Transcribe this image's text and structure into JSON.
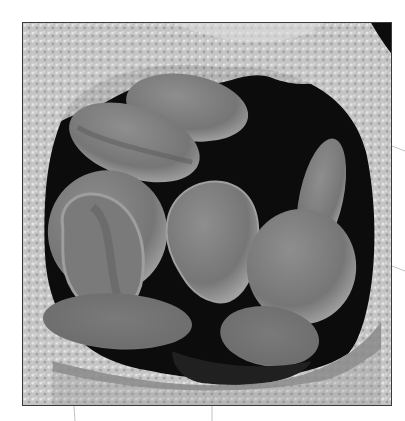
{
  "figure": {
    "type": "scanning-electron-micrograph",
    "colors": {
      "background": "#ffffff",
      "lumen": "#0c0c0c",
      "cell": "#7c7c7c",
      "cell_highlight": "#a0a0a0",
      "vessel_wall": "#c8c8c8",
      "border": "#3a3a3a",
      "leader": "#b8b8b8"
    },
    "leader_lines": [
      {
        "side": "right",
        "y": 148
      },
      {
        "side": "right",
        "y": 268
      },
      {
        "side": "bottom",
        "x": 74
      },
      {
        "side": "bottom",
        "x": 212
      }
    ]
  }
}
